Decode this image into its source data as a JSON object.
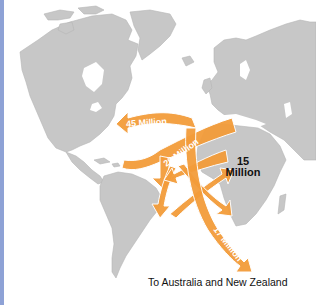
{
  "map": {
    "colors": {
      "land": "#c7c7c7",
      "ocean": "#ffffff",
      "flow": "#f39c3a",
      "left_strip": "#8ea2d6"
    },
    "flows": [
      {
        "label": "45 Million",
        "direction": "Europe to North America"
      },
      {
        "label": "20 Million",
        "direction": "Europe/Atlantic to Caribbean and Latin America"
      },
      {
        "label": "17 Million",
        "direction": "To Australia and New Zealand"
      }
    ],
    "labels": {
      "africa_value": "15",
      "africa_unit": "Million",
      "caption": "To Australia and New Zealand"
    }
  }
}
